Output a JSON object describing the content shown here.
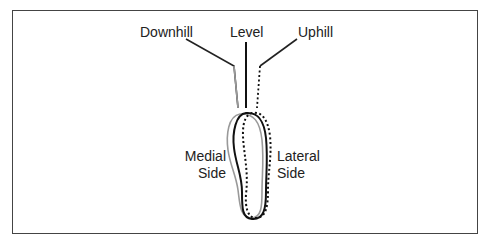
{
  "diagram": {
    "labels": {
      "downhill": "Downhill",
      "level": "Level",
      "uphill": "Uphill",
      "medial_line1": "Medial",
      "medial_line2": "Side",
      "lateral_line1": "Lateral",
      "lateral_line2": "Side"
    },
    "series": [
      {
        "name": "Downhill",
        "style": "solid-gray",
        "color": "#999999"
      },
      {
        "name": "Level",
        "style": "solid-black",
        "color": "#111111"
      },
      {
        "name": "Uphill",
        "style": "dotted-black",
        "color": "#111111"
      }
    ]
  }
}
